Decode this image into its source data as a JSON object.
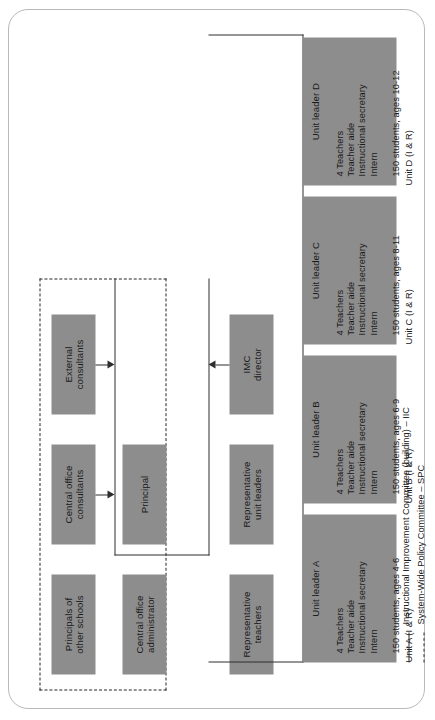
{
  "diagram": {
    "box_fill": "#8d8d8d",
    "line_color": "#2e2e2e",
    "frame_color": "#b9b9b9"
  },
  "advisory_boxes": [
    {
      "id": "principals-other-schools",
      "lines": [
        "Principals of",
        "other schools"
      ]
    },
    {
      "id": "central-office-consultants",
      "lines": [
        "Central office",
        "consultants"
      ]
    },
    {
      "id": "external-consultants",
      "lines": [
        "External",
        "consultants"
      ]
    },
    {
      "id": "central-office-administrator",
      "lines": [
        "Central office",
        "administrator"
      ]
    },
    {
      "id": "principal",
      "lines": [
        "Principal"
      ]
    },
    {
      "id": "representative-teachers",
      "lines": [
        "Representative",
        "teachers"
      ]
    },
    {
      "id": "representative-unit-leaders",
      "lines": [
        "Representative",
        "unit leaders"
      ]
    },
    {
      "id": "imc-director",
      "lines": [
        "IMC",
        "director"
      ]
    }
  ],
  "units": [
    {
      "id": "unit-a",
      "header": "Unit leader A",
      "staff": [
        "4 Teachers",
        "Teacher aide",
        "Instructional secretary",
        "Intern"
      ],
      "students": "150 students, ages 4-6",
      "caption": "Unit A  (I & R)"
    },
    {
      "id": "unit-b",
      "header": "Unit leader B",
      "staff": [
        "4 Teachers",
        "Teacher aide",
        "Instructional secretary",
        "Intern"
      ],
      "students": "150 students, ages 6-9",
      "caption": "Unit B  (I & R)"
    },
    {
      "id": "unit-c",
      "header": "Unit leader C",
      "staff": [
        "4 Teachers",
        "Teacher aide",
        "Instructional secretary",
        "Intern"
      ],
      "students": "150 students, ages 8-11",
      "caption": "Unit C  (I & R)"
    },
    {
      "id": "unit-d",
      "header": "Unit leader D",
      "staff": [
        "4 Teachers",
        "Teacher aide",
        "Instructional secretary",
        "Intern"
      ],
      "students": "150 students, ages 10-12",
      "caption": "Unit D  (I & R)"
    }
  ],
  "legend": [
    {
      "style": "solid",
      "label": "Instructional Improvement Committee (building) – IIC"
    },
    {
      "style": "dashed",
      "label": "System-Wide Policy Committee – SPC"
    }
  ]
}
